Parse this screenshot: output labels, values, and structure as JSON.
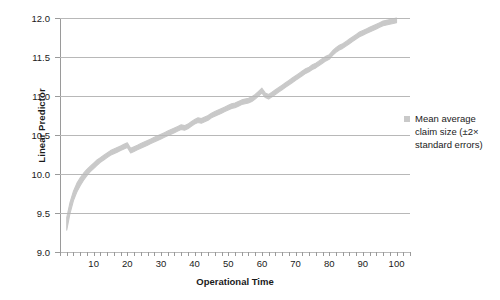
{
  "chart_data": {
    "type": "area",
    "title": "",
    "xlabel": "Operational Time",
    "ylabel": "Linear Predictor",
    "xlim": [
      0,
      104
    ],
    "ylim": [
      9.0,
      12.0
    ],
    "grid": true,
    "legend_position": "right",
    "x_ticks": [
      10,
      20,
      30,
      40,
      50,
      60,
      70,
      80,
      90,
      100
    ],
    "x_minor_tick_step": 2,
    "y_ticks": [
      "9.0",
      "9.5",
      "10.0",
      "10.5",
      "11.0",
      "11.5",
      "12.0"
    ],
    "band_color": "#c9c9c9",
    "gridline_color": "#b8b8b8",
    "axis_color": "#9a9a9a",
    "series": [
      {
        "name": "Mean average claim size (±2× standard errors)",
        "x": [
          2,
          3,
          4,
          5,
          6,
          7,
          8,
          9,
          10,
          11,
          12,
          13,
          14,
          15,
          16,
          17,
          18,
          19,
          20,
          21,
          22,
          23,
          24,
          25,
          26,
          27,
          28,
          29,
          30,
          31,
          32,
          33,
          34,
          35,
          36,
          37,
          38,
          39,
          40,
          41,
          42,
          43,
          44,
          45,
          46,
          47,
          48,
          49,
          50,
          51,
          52,
          53,
          54,
          55,
          56,
          57,
          58,
          59,
          60,
          61,
          62,
          63,
          64,
          65,
          66,
          67,
          68,
          69,
          70,
          71,
          72,
          73,
          74,
          75,
          76,
          77,
          78,
          79,
          80,
          81,
          82,
          83,
          84,
          85,
          86,
          87,
          88,
          89,
          90,
          91,
          92,
          93,
          94,
          95,
          96,
          97,
          98,
          99,
          100
        ],
        "upper": [
          9.44,
          9.64,
          9.78,
          9.88,
          9.95,
          10.01,
          10.06,
          10.1,
          10.14,
          10.18,
          10.21,
          10.24,
          10.27,
          10.3,
          10.32,
          10.34,
          10.36,
          10.38,
          10.4,
          10.33,
          10.35,
          10.37,
          10.39,
          10.41,
          10.43,
          10.45,
          10.47,
          10.49,
          10.51,
          10.53,
          10.55,
          10.57,
          10.59,
          10.61,
          10.63,
          10.62,
          10.64,
          10.67,
          10.7,
          10.72,
          10.71,
          10.73,
          10.75,
          10.78,
          10.8,
          10.82,
          10.84,
          10.86,
          10.88,
          10.9,
          10.91,
          10.93,
          10.95,
          10.96,
          10.97,
          10.99,
          11.02,
          11.06,
          11.1,
          11.04,
          11.02,
          11.05,
          11.08,
          11.11,
          11.14,
          11.17,
          11.2,
          11.23,
          11.26,
          11.29,
          11.32,
          11.35,
          11.37,
          11.4,
          11.42,
          11.45,
          11.48,
          11.51,
          11.53,
          11.58,
          11.62,
          11.65,
          11.67,
          11.7,
          11.73,
          11.76,
          11.79,
          11.82,
          11.84,
          11.86,
          11.88,
          11.9,
          11.92,
          11.94,
          11.96,
          11.97,
          11.98,
          11.99,
          12.0
        ],
        "lower": [
          9.28,
          9.5,
          9.66,
          9.77,
          9.85,
          9.92,
          9.98,
          10.03,
          10.07,
          10.11,
          10.15,
          10.18,
          10.21,
          10.24,
          10.26,
          10.28,
          10.3,
          10.32,
          10.34,
          10.27,
          10.29,
          10.31,
          10.33,
          10.35,
          10.37,
          10.39,
          10.41,
          10.43,
          10.45,
          10.47,
          10.49,
          10.51,
          10.53,
          10.55,
          10.57,
          10.56,
          10.58,
          10.61,
          10.64,
          10.66,
          10.65,
          10.67,
          10.69,
          10.72,
          10.74,
          10.76,
          10.78,
          10.8,
          10.82,
          10.84,
          10.85,
          10.87,
          10.89,
          10.9,
          10.91,
          10.93,
          10.96,
          11.0,
          11.04,
          10.98,
          10.96,
          10.99,
          11.02,
          11.05,
          11.08,
          11.11,
          11.14,
          11.17,
          11.2,
          11.23,
          11.26,
          11.29,
          11.31,
          11.34,
          11.36,
          11.39,
          11.42,
          11.45,
          11.47,
          11.52,
          11.56,
          11.59,
          11.61,
          11.64,
          11.67,
          11.7,
          11.73,
          11.76,
          11.78,
          11.8,
          11.82,
          11.84,
          11.86,
          11.88,
          11.9,
          11.91,
          11.92,
          11.93,
          11.94
        ]
      }
    ]
  },
  "legend": {
    "label": "Mean average claim size (±2× standard errors)"
  },
  "axes": {
    "y_title": "Linear Predictor",
    "x_title": "Operational Time"
  }
}
